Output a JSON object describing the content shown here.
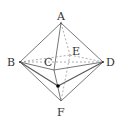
{
  "diagram": {
    "type": "octahedron-geometry-figure",
    "labels": {
      "A": "A",
      "B": "B",
      "C": "C",
      "D": "D",
      "E": "E",
      "F": "F"
    },
    "colors": {
      "line": "#555555",
      "dashed": "#888888",
      "point": "#000000"
    }
  }
}
